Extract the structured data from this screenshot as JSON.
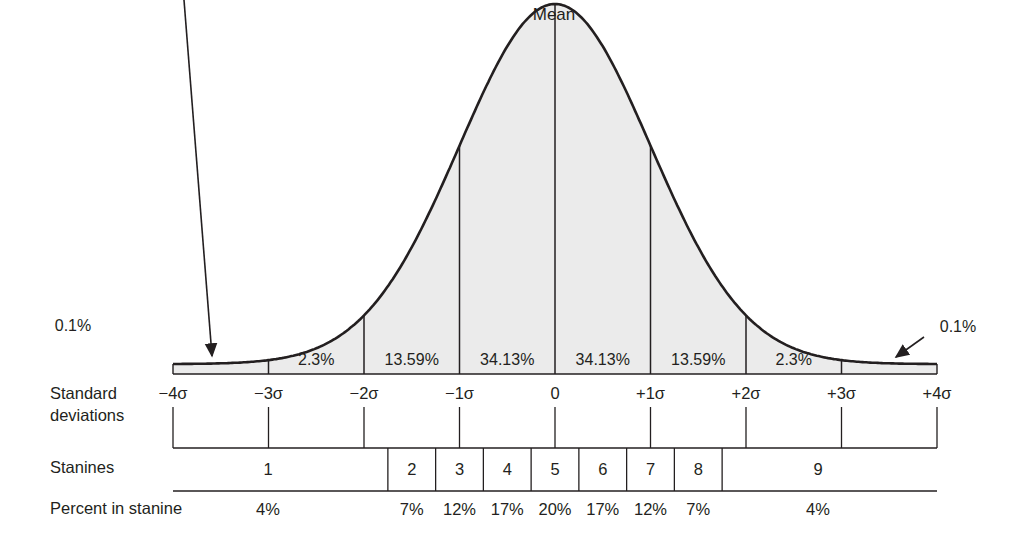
{
  "chart_data": {
    "type": "area",
    "peak_label": "Mean",
    "tail_labels": {
      "left": "0.1%",
      "right": "0.1%"
    },
    "sigma_ticks": [
      "-4σ",
      "-3σ",
      "-2σ",
      "-1σ",
      "0",
      "+1σ",
      "+2σ",
      "+3σ",
      "+4σ"
    ],
    "sigma_values": [
      -4,
      -3,
      -2,
      -1,
      0,
      1,
      2,
      3,
      4
    ],
    "area_segments": [
      {
        "from": -4,
        "to": -3,
        "percent": "0.1%"
      },
      {
        "from": -3,
        "to": -2,
        "percent": "2.3%"
      },
      {
        "from": -2,
        "to": -1,
        "percent": "13.59%"
      },
      {
        "from": -1,
        "to": 0,
        "percent": "34.13%"
      },
      {
        "from": 0,
        "to": 1,
        "percent": "34.13%"
      },
      {
        "from": 1,
        "to": 2,
        "percent": "13.59%"
      },
      {
        "from": 2,
        "to": 3,
        "percent": "2.3%"
      },
      {
        "from": 3,
        "to": 4,
        "percent": "0.1%"
      }
    ],
    "stanines": [
      {
        "stanine": "1",
        "percent": "4%",
        "from": -4,
        "to": -1.75
      },
      {
        "stanine": "2",
        "percent": "7%",
        "from": -1.75,
        "to": -1.25
      },
      {
        "stanine": "3",
        "percent": "12%",
        "from": -1.25,
        "to": -0.75
      },
      {
        "stanine": "4",
        "percent": "17%",
        "from": -0.75,
        "to": -0.25
      },
      {
        "stanine": "5",
        "percent": "20%",
        "from": -0.25,
        "to": 0.25
      },
      {
        "stanine": "6",
        "percent": "17%",
        "from": 0.25,
        "to": 0.75
      },
      {
        "stanine": "7",
        "percent": "12%",
        "from": 0.75,
        "to": 1.25
      },
      {
        "stanine": "8",
        "percent": "7%",
        "from": 1.25,
        "to": 1.75
      },
      {
        "stanine": "9",
        "percent": "4%",
        "from": 1.75,
        "to": 4
      }
    ],
    "xlabel": "Standard deviations",
    "ylabel": "",
    "xlim": [
      -4,
      4
    ],
    "grid": false,
    "fill_color": "#ebebeb",
    "line_color": "#231f20"
  },
  "labels": {
    "std_dev_line1": "Standard",
    "std_dev_line2": "deviations",
    "stanines": "Stanines",
    "percent_in_stanine": "Percent in stanine"
  }
}
